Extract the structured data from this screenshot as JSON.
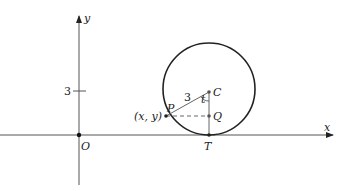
{
  "diagram": {
    "axes": {
      "x_label": "x",
      "y_label": "y",
      "origin_label": "O",
      "y_tick_label": "3"
    },
    "points": {
      "center": "C",
      "point_on_circle": "P",
      "point_coords": "(x, y)",
      "foot": "Q",
      "tangent_point": "T"
    },
    "segments": {
      "radius_label": "3",
      "angle_label": "t"
    },
    "colors": {
      "stroke": "#222222",
      "axis": "#555555",
      "background": "#ffffff"
    }
  }
}
